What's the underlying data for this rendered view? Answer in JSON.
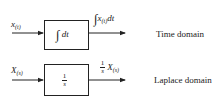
{
  "diagram": {
    "type": "block-diagram",
    "colors": {
      "line": "#222222",
      "background": "#ffffff"
    },
    "rows": [
      {
        "domain_label": "Time domain",
        "input": {
          "symbol": "x",
          "subscript": "(t)"
        },
        "block": {
          "integral_symbol": "∫",
          "operand": "dt"
        },
        "output": {
          "integral_symbol": "∫",
          "symbol": "x",
          "subscript": "(t)",
          "suffix": "dt"
        }
      },
      {
        "domain_label": "Laplace domain",
        "input": {
          "symbol": "X",
          "subscript": "(s)"
        },
        "block": {
          "numerator": "1",
          "denominator": "s"
        },
        "output": {
          "numerator": "1",
          "denominator": "s",
          "symbol": "X",
          "subscript": "(s)"
        }
      }
    ]
  }
}
